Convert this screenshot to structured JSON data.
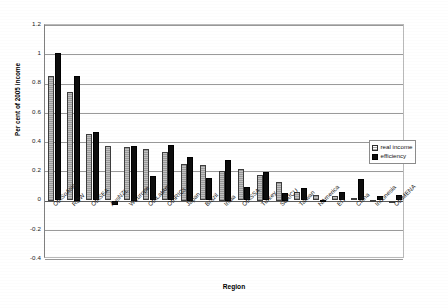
{
  "chart_data": {
    "type": "bar",
    "title": "",
    "xlabel": "Region",
    "ylabel": "Per cent of 2005 income",
    "ylim": [
      -0.4,
      1.2
    ],
    "yticks": [
      "1.2",
      "1",
      "0.8",
      "0.6",
      "0.4",
      "0.2",
      "0",
      "-0.2",
      "-0.4"
    ],
    "ytick_values": [
      1.2,
      1,
      0.8,
      0.6,
      0.4,
      0.2,
      0,
      -0.2,
      -0.4
    ],
    "grid": true,
    "legend_position": "right-middle",
    "categories": [
      "OthSoAsia",
      "ROW",
      "OthSEA",
      "AusNZL",
      "WEurope",
      "OthLatAm",
      "OthRICs",
      "Japan",
      "Brazil",
      "India",
      "OthSSA",
      "Turkey",
      "SoAfCU",
      "Taiwan",
      "NAmerica",
      "EIT",
      "China",
      "Indonesia",
      "OthMENA"
    ],
    "series": [
      {
        "name": "real income",
        "values": [
          0.85,
          0.74,
          0.455,
          0.37,
          0.365,
          0.355,
          0.33,
          0.25,
          0.24,
          0.2,
          0.215,
          0.175,
          0.125,
          0.055,
          0.04,
          0.03,
          0.015,
          0.005,
          0.0
        ]
      },
      {
        "name": "efficiency",
        "values": [
          1.01,
          0.85,
          0.465,
          -0.03,
          0.375,
          0.17,
          0.38,
          0.3,
          0.155,
          0.275,
          0.095,
          0.195,
          0.05,
          0.085,
          0.005,
          0.055,
          0.145,
          0.03,
          0.035
        ]
      }
    ]
  },
  "legend": {
    "items": [
      {
        "label": "real income",
        "style": "hatched-gray"
      },
      {
        "label": "efficiency",
        "style": "solid-black"
      }
    ]
  },
  "colors": {
    "real_income": "#a6a6a6",
    "efficiency": "#0d0d0d",
    "gridline": "#9a9a9a",
    "axis": "#808080",
    "background": "#ffffff"
  }
}
